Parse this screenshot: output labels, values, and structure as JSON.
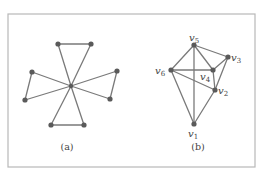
{
  "figure": {
    "frame": {
      "x": 8,
      "y": 14,
      "width": 247,
      "height": 153
    },
    "colors": {
      "edge": "#7a7a7a",
      "vertex": "#5a5a5a",
      "text": "#444444",
      "frame": "#b8b8b8"
    },
    "panels": [
      {
        "id": "a",
        "caption": "(a)",
        "caption_pos": [
          67,
          150
        ],
        "center": {
          "x": 71,
          "y": 86
        },
        "vertices": [
          {
            "x": 58,
            "y": 44
          },
          {
            "x": 91,
            "y": 44
          },
          {
            "x": 117,
            "y": 71
          },
          {
            "x": 110,
            "y": 99
          },
          {
            "x": 84,
            "y": 125
          },
          {
            "x": 51,
            "y": 125
          },
          {
            "x": 25,
            "y": 100
          },
          {
            "x": 32,
            "y": 72
          }
        ],
        "outer_edges": [
          [
            0,
            1
          ],
          [
            2,
            3
          ],
          [
            4,
            5
          ],
          [
            6,
            7
          ]
        ]
      },
      {
        "id": "b",
        "caption": "(b)",
        "caption_pos": [
          198,
          150
        ],
        "vertices": [
          {
            "name": "v",
            "sub": "1",
            "x": 194,
            "y": 124,
            "lx": 188,
            "ly": 137
          },
          {
            "name": "v",
            "sub": "2",
            "x": 215,
            "y": 90,
            "lx": 218,
            "ly": 94
          },
          {
            "name": "v",
            "sub": "3",
            "x": 228,
            "y": 57,
            "lx": 231,
            "ly": 61
          },
          {
            "name": "v",
            "sub": "4",
            "x": 213,
            "y": 70,
            "lx": 200,
            "ly": 80
          },
          {
            "name": "v",
            "sub": "5",
            "x": 194,
            "y": 45,
            "lx": 189,
            "ly": 41
          },
          {
            "name": "v",
            "sub": "6",
            "x": 171,
            "y": 70,
            "lx": 155,
            "ly": 74
          }
        ],
        "edges": [
          [
            4,
            5
          ],
          [
            4,
            2
          ],
          [
            4,
            3
          ],
          [
            4,
            0
          ],
          [
            5,
            3
          ],
          [
            5,
            1
          ],
          [
            5,
            0
          ],
          [
            2,
            3
          ],
          [
            2,
            1
          ],
          [
            3,
            1
          ],
          [
            1,
            0
          ]
        ]
      }
    ]
  }
}
